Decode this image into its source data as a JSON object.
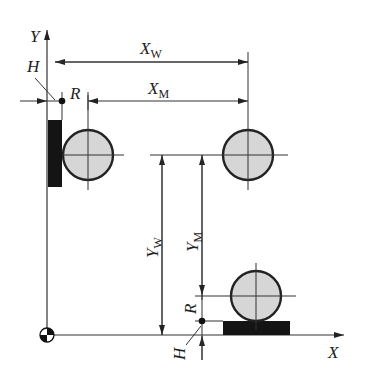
{
  "diagram": {
    "type": "machining coordinate dimension diagram",
    "axes": {
      "x_label": "X",
      "y_label": "Y"
    },
    "labels": {
      "xw_main": "X",
      "xw_sub": "W",
      "xm_main": "X",
      "xm_sub": "M",
      "yw_main": "Y",
      "yw_sub": "W",
      "ym_main": "Y",
      "ym_sub": "M",
      "h_top": "H",
      "r_top": "R",
      "h_bottom": "H",
      "r_bottom": "R"
    },
    "colors": {
      "line": "#333333",
      "circle_fill": "#d6d6d6",
      "block_fill": "#141414",
      "background": "#ffffff"
    }
  }
}
